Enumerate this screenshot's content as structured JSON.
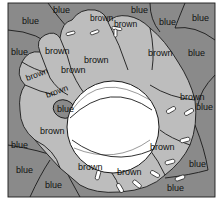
{
  "puzzle": {
    "subject": "baseball glove with ball",
    "colors": {
      "blue": "#8a8a8a",
      "brown": "#bdbdbd",
      "ball": "#ffffff",
      "outline": "#1a1a1a"
    },
    "labels": [
      {
        "id": "l1",
        "text": "blue",
        "x": 22,
        "y": 24
      },
      {
        "id": "l2",
        "text": "blue",
        "x": 53,
        "y": 13
      },
      {
        "id": "l3",
        "text": "brown",
        "x": 90,
        "y": 21
      },
      {
        "id": "l4",
        "text": "brown",
        "x": 114,
        "y": 27
      },
      {
        "id": "l5",
        "text": "blue",
        "x": 131,
        "y": 13
      },
      {
        "id": "l6",
        "text": "blue",
        "x": 159,
        "y": 25
      },
      {
        "id": "l7",
        "text": "blue",
        "x": 192,
        "y": 21
      },
      {
        "id": "l8",
        "text": "blue",
        "x": 11,
        "y": 55
      },
      {
        "id": "l9",
        "text": "brown",
        "x": 45,
        "y": 54
      },
      {
        "id": "l10",
        "text": "brown",
        "x": 84,
        "y": 63
      },
      {
        "id": "l11",
        "text": "brown",
        "x": 148,
        "y": 56
      },
      {
        "id": "l12",
        "text": "blue",
        "x": 188,
        "y": 56
      },
      {
        "id": "l13",
        "text": "brown",
        "x": 27,
        "y": 81
      },
      {
        "id": "l14",
        "text": "brown",
        "x": 61,
        "y": 73
      },
      {
        "id": "l15",
        "text": "brown",
        "x": 47,
        "y": 98
      },
      {
        "id": "l16",
        "text": "blue",
        "x": 61,
        "y": 111
      },
      {
        "id": "l17",
        "text": "brown",
        "x": 190,
        "y": 100
      },
      {
        "id": "l18",
        "text": "blue",
        "x": 198,
        "y": 110
      },
      {
        "id": "l19",
        "text": "brown",
        "x": 48,
        "y": 134
      },
      {
        "id": "l20",
        "text": "blue",
        "x": 15,
        "y": 148
      },
      {
        "id": "l21",
        "text": "brown",
        "x": 163,
        "y": 150
      },
      {
        "id": "l22",
        "text": "brown",
        "x": 93,
        "y": 170
      },
      {
        "id": "l23",
        "text": "blue",
        "x": 26,
        "y": 173
      },
      {
        "id": "l24",
        "text": "brown",
        "x": 130,
        "y": 175
      },
      {
        "id": "l25",
        "text": "blue",
        "x": 188,
        "y": 167
      },
      {
        "id": "l26",
        "text": "blue",
        "x": 54,
        "y": 188
      },
      {
        "id": "l27",
        "text": "blue",
        "x": 174,
        "y": 189
      }
    ]
  }
}
